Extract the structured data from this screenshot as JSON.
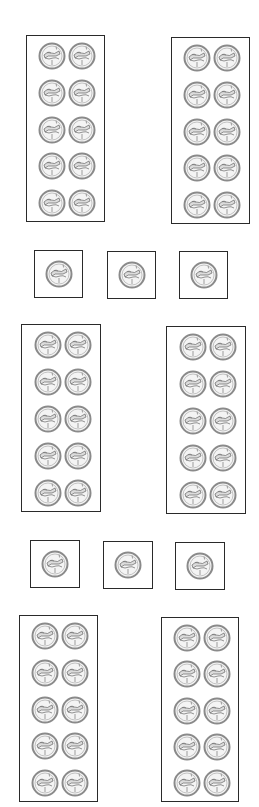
{
  "worksheet": {
    "item": "coin",
    "coin_icon": "penny-coin-icon",
    "colors": {
      "border": "#2a2a2a",
      "coin_rim": "#8a8a8a",
      "coin_fill": "#f2f2f2",
      "coin_detail": "#6a6a6a"
    },
    "groups": [
      {
        "id": "ten-frame-1",
        "type": "group-of-10",
        "x": 26,
        "y": 35,
        "w": 79,
        "h": 187,
        "rows": 5,
        "cols": 2,
        "count": 10
      },
      {
        "id": "ten-frame-2",
        "type": "group-of-10",
        "x": 171,
        "y": 37,
        "w": 79,
        "h": 187,
        "rows": 5,
        "cols": 2,
        "count": 10
      },
      {
        "id": "single-1",
        "type": "single",
        "x": 34,
        "y": 250,
        "w": 49,
        "h": 48,
        "count": 1
      },
      {
        "id": "single-2",
        "type": "single",
        "x": 107,
        "y": 251,
        "w": 49,
        "h": 48,
        "count": 1
      },
      {
        "id": "single-3",
        "type": "single",
        "x": 179,
        "y": 251,
        "w": 49,
        "h": 48,
        "count": 1
      },
      {
        "id": "ten-frame-3",
        "type": "group-of-10",
        "x": 21,
        "y": 324,
        "w": 80,
        "h": 188,
        "rows": 5,
        "cols": 2,
        "count": 10
      },
      {
        "id": "ten-frame-4",
        "type": "group-of-10",
        "x": 166,
        "y": 326,
        "w": 80,
        "h": 188,
        "rows": 5,
        "cols": 2,
        "count": 10
      },
      {
        "id": "single-4",
        "type": "single",
        "x": 30,
        "y": 540,
        "w": 50,
        "h": 48,
        "count": 1
      },
      {
        "id": "single-5",
        "type": "single",
        "x": 103,
        "y": 541,
        "w": 50,
        "h": 48,
        "count": 1
      },
      {
        "id": "single-6",
        "type": "single",
        "x": 175,
        "y": 542,
        "w": 50,
        "h": 48,
        "count": 1
      },
      {
        "id": "ten-frame-5",
        "type": "group-of-10",
        "x": 19,
        "y": 615,
        "w": 79,
        "h": 187,
        "rows": 5,
        "cols": 2,
        "count": 10
      },
      {
        "id": "ten-frame-6",
        "type": "group-of-10",
        "x": 161,
        "y": 617,
        "w": 78,
        "h": 185,
        "rows": 5,
        "cols": 2,
        "count": 10
      }
    ],
    "total_coins": 66
  }
}
